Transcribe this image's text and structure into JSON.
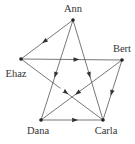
{
  "diagram": {
    "type": "directed-graph",
    "nodes": [
      {
        "id": "ann",
        "label": "Ann",
        "x": 73,
        "y": 20,
        "lx": 73,
        "ly": 12,
        "anchor": "middle"
      },
      {
        "id": "bert",
        "label": "Bert",
        "x": 122,
        "y": 60,
        "lx": 122,
        "ly": 52,
        "anchor": "middle"
      },
      {
        "id": "carla",
        "label": "Carla",
        "x": 103,
        "y": 120,
        "lx": 106,
        "ly": 134,
        "anchor": "middle"
      },
      {
        "id": "dana",
        "label": "Dana",
        "x": 41,
        "y": 120,
        "lx": 38,
        "ly": 134,
        "anchor": "middle"
      },
      {
        "id": "ehaz",
        "label": "Ehaz",
        "x": 21,
        "y": 59,
        "lx": 16,
        "ly": 77,
        "anchor": "middle"
      }
    ],
    "edges": [
      {
        "from": "ann",
        "to": "ehaz"
      },
      {
        "from": "ann",
        "to": "carla"
      },
      {
        "from": "ann",
        "to": "dana"
      },
      {
        "from": "ehaz",
        "to": "bert"
      },
      {
        "from": "ehaz",
        "to": "carla"
      },
      {
        "from": "bert",
        "to": "dana"
      },
      {
        "from": "bert",
        "to": "carla"
      },
      {
        "from": "dana",
        "to": "carla"
      }
    ]
  }
}
